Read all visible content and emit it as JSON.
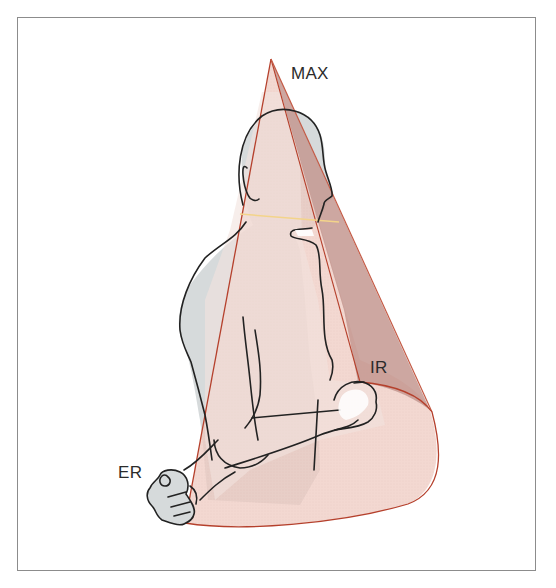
{
  "figure": {
    "labels": {
      "max": "MAX",
      "internal_rotation": "IR",
      "external_rotation": "ER"
    },
    "colors": {
      "frame_border": "#8c8c8c",
      "cone_fill": "#efc9bf",
      "cone_outline": "#b5402c",
      "cone_dark_side": "#c49890",
      "body_fill": "#d6dadb",
      "body_outline": "#222222",
      "neck_line": "#f3d48a"
    }
  }
}
